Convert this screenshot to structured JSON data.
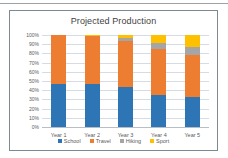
{
  "chart": {
    "title": "Projected Production",
    "frame_border_color": "#7e8a93"
  },
  "chart_data": {
    "type": "bar",
    "subtype": "100% stacked column",
    "title": "Projected Production",
    "xlabel": "",
    "ylabel": "",
    "categories": [
      "Year 1",
      "Year 2",
      "Year 3",
      "Year 4",
      "Year 5"
    ],
    "series": [
      {
        "name": "School",
        "color": "#2e75b6",
        "values": [
          47,
          47,
          43,
          35,
          33
        ]
      },
      {
        "name": "Travel",
        "color": "#ed7d31",
        "values": [
          53,
          52,
          50,
          50,
          45
        ]
      },
      {
        "name": "Hiking",
        "color": "#a5a5a5",
        "values": [
          0,
          0,
          4,
          6,
          9
        ]
      },
      {
        "name": "Sport",
        "color": "#ffc000",
        "values": [
          0,
          1,
          3,
          9,
          13
        ]
      }
    ],
    "ylim": [
      0,
      100
    ],
    "ytick_labels": [
      "100%",
      "90%",
      "80%",
      "70%",
      "60%",
      "50%",
      "40%",
      "30%",
      "20%",
      "10%",
      "0%"
    ],
    "ytick_values": [
      100,
      90,
      80,
      70,
      60,
      50,
      40,
      30,
      20,
      10,
      0
    ],
    "grid": true,
    "legend_position": "bottom"
  }
}
